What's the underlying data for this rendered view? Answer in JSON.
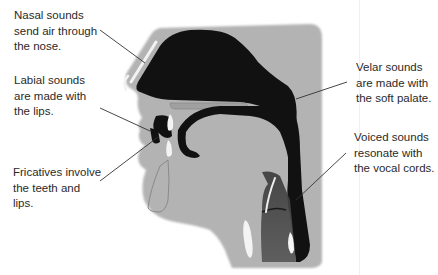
{
  "diagram": {
    "type": "vocal-tract-cross-section",
    "colors": {
      "background": "#ffffff",
      "head_fill": "#b3b3b3",
      "cavity_fill": "#111111",
      "bone_highlight": "#f4f4f4",
      "leader_line": "#333333",
      "label_text": "#2a2a2a"
    },
    "labels": {
      "nasal": {
        "lines": [
          "Nasal sounds",
          "send air through",
          "the nose."
        ]
      },
      "labial": {
        "lines": [
          "Labial sounds",
          "are made with",
          "the lips."
        ]
      },
      "fricatives": {
        "lines": [
          "Fricatives involve",
          "the teeth and",
          "lips."
        ]
      },
      "velar": {
        "lines": [
          "Velar sounds",
          "are made with",
          "the soft palate."
        ]
      },
      "voiced": {
        "lines": [
          "Voiced sounds",
          "resonate with",
          "the vocal cords."
        ]
      }
    }
  }
}
